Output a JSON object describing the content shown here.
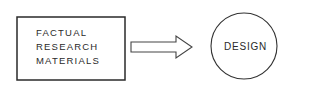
{
  "diagram": {
    "type": "flow",
    "nodes": [
      {
        "id": "source",
        "shape": "rectangle",
        "lines": [
          "FACTUAL",
          "RESEARCH",
          "MATERIALS"
        ]
      },
      {
        "id": "target",
        "shape": "circle",
        "label": "DESIGN"
      }
    ],
    "edges": [
      {
        "from": "source",
        "to": "target",
        "style": "block-arrow"
      }
    ],
    "colors": {
      "stroke": "#2a2a2a",
      "background": "#ffffff"
    }
  }
}
